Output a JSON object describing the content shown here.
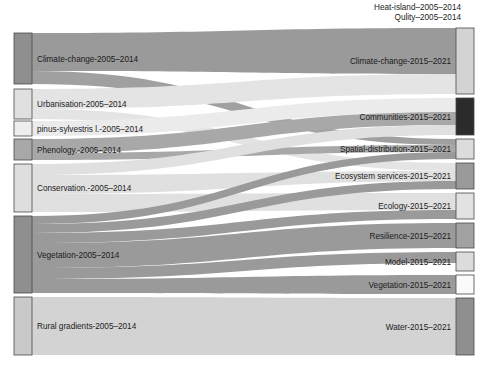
{
  "figure": {
    "type": "sankey",
    "title": "",
    "width": 485,
    "height": 365,
    "background": "#ffffff"
  },
  "floating_labels": [
    {
      "text": "Heat-island–2005–2014",
      "x": 461,
      "y": 10,
      "anchor": "end"
    },
    {
      "text": "Qulity–2005–2014",
      "x": 461,
      "y": 20,
      "anchor": "end"
    }
  ],
  "colors": {
    "node_stroke": "#4a4a4a",
    "dark": "#2b2b2b",
    "mid_dark": "#8f8f8f",
    "mid": "#a8a8a8",
    "light": "#d3d3d3",
    "very_light": "#e8e8e8",
    "near_white": "#f7f7f7",
    "label": "#1b1b1b"
  },
  "chart_data": {
    "type": "sankey",
    "title": "",
    "xlabel": "",
    "ylabel": "",
    "nodes_left": [
      {
        "id": "L0",
        "label": "Climate-change-2005–2014",
        "x": 14,
        "y": 33,
        "w": 18,
        "h": 51,
        "color": "#8f8f8f",
        "value": 51
      },
      {
        "id": "L1",
        "label": "Urbanisation-2005–2014",
        "x": 14,
        "y": 89,
        "w": 18,
        "h": 30,
        "color": "#e0e0e0",
        "value": 30
      },
      {
        "id": "L2",
        "label": "pinus-sylvestris l.-2005–2014",
        "x": 14,
        "y": 121,
        "w": 18,
        "h": 15,
        "color": "#eeeeee",
        "value": 15
      },
      {
        "id": "L3",
        "label": "Phenology.-2005–2014",
        "x": 14,
        "y": 139,
        "w": 18,
        "h": 21,
        "color": "#a8a8a8",
        "value": 21
      },
      {
        "id": "L4",
        "label": "Conservation.-2005–2014",
        "x": 14,
        "y": 164,
        "w": 18,
        "h": 48,
        "color": "#dedede",
        "value": 48
      },
      {
        "id": "L5",
        "label": "Vegetation-2005–2014",
        "x": 14,
        "y": 216,
        "w": 18,
        "h": 77,
        "color": "#8f8f8f",
        "value": 77
      },
      {
        "id": "L6",
        "label": "Rural gradients-2005–2014",
        "x": 14,
        "y": 297,
        "w": 18,
        "h": 58,
        "color": "#c9c9c9",
        "value": 58
      }
    ],
    "nodes_right": [
      {
        "id": "R0",
        "label": "Climate-change-2015–2021",
        "x": 456,
        "y": 28,
        "w": 18,
        "h": 66,
        "color": "#d3d3d3",
        "value": 66
      },
      {
        "id": "R1",
        "label": "Communities-2015–2021",
        "x": 456,
        "y": 98,
        "w": 18,
        "h": 37,
        "color": "#2b2b2b",
        "value": 37
      },
      {
        "id": "R2",
        "label": "Spatial-distribution-2015–2021",
        "x": 456,
        "y": 139,
        "w": 18,
        "h": 20,
        "color": "#dcdcdc",
        "value": 20
      },
      {
        "id": "R3",
        "label": "Ecosystem services-2015–2021",
        "x": 456,
        "y": 163,
        "w": 18,
        "h": 26,
        "color": "#9a9a9a",
        "value": 26
      },
      {
        "id": "R4",
        "label": "Ecology-2015–2021",
        "x": 456,
        "y": 193,
        "w": 18,
        "h": 26,
        "color": "#e2e2e2",
        "value": 26
      },
      {
        "id": "R5",
        "label": "Resilience-2015–2021",
        "x": 456,
        "y": 223,
        "w": 18,
        "h": 25,
        "color": "#a2a2a2",
        "value": 25
      },
      {
        "id": "R6",
        "label": "Model-2015–2021",
        "x": 456,
        "y": 252,
        "w": 18,
        "h": 19,
        "color": "#dcdcdc",
        "value": 19
      },
      {
        "id": "R7",
        "label": "Vegetation-2015–2021",
        "x": 456,
        "y": 275,
        "w": 18,
        "h": 19,
        "color": "#fafafa",
        "value": 19
      },
      {
        "id": "R8",
        "label": "Water-2015–2021",
        "x": 456,
        "y": 298,
        "w": 18,
        "h": 57,
        "color": "#8f8f8f",
        "value": 57
      }
    ],
    "links": [
      {
        "source": "L0",
        "target": "R0",
        "value": 38,
        "color": "#9a9a9a",
        "sy": 33,
        "ty": 28,
        "sh": 38,
        "th": 46
      },
      {
        "source": "L0",
        "target": "R2",
        "value": 13,
        "color": "#a0a0a0",
        "sy": 71,
        "ty": 139,
        "sh": 13,
        "th": 6
      },
      {
        "source": "L1",
        "target": "R0",
        "value": 20,
        "color": "#e4e4e4",
        "sy": 89,
        "ty": 74,
        "sh": 20,
        "th": 20
      },
      {
        "source": "L1",
        "target": "R3",
        "value": 10,
        "color": "#e4e4e4",
        "sy": 109,
        "ty": 163,
        "sh": 10,
        "th": 8
      },
      {
        "source": "L2",
        "target": "R1",
        "value": 15,
        "color": "#ebebeb",
        "sy": 121,
        "ty": 98,
        "sh": 15,
        "th": 14
      },
      {
        "source": "L3",
        "target": "R1",
        "value": 14,
        "color": "#a8a8a8",
        "sy": 139,
        "ty": 112,
        "sh": 14,
        "th": 13
      },
      {
        "source": "L3",
        "target": "R2",
        "value": 7,
        "color": "#a8a8a8",
        "sy": 153,
        "ty": 145,
        "sh": 7,
        "th": 7
      },
      {
        "source": "L4",
        "target": "R1",
        "value": 11,
        "color": "#e0e0e0",
        "sy": 164,
        "ty": 125,
        "sh": 11,
        "th": 10
      },
      {
        "source": "L4",
        "target": "R3",
        "value": 19,
        "color": "#e0e0e0",
        "sy": 175,
        "ty": 171,
        "sh": 19,
        "th": 10
      },
      {
        "source": "L4",
        "target": "R4",
        "value": 18,
        "color": "#e0e0e0",
        "sy": 194,
        "ty": 193,
        "sh": 18,
        "th": 17
      },
      {
        "source": "L5",
        "target": "R2",
        "value": 8,
        "color": "#9a9a9a",
        "sy": 216,
        "ty": 152,
        "sh": 8,
        "th": 7
      },
      {
        "source": "L5",
        "target": "R3",
        "value": 9,
        "color": "#9a9a9a",
        "sy": 224,
        "ty": 181,
        "sh": 9,
        "th": 8
      },
      {
        "source": "L5",
        "target": "R4",
        "value": 10,
        "color": "#9a9a9a",
        "sy": 233,
        "ty": 210,
        "sh": 10,
        "th": 9
      },
      {
        "source": "L5",
        "target": "R5",
        "value": 25,
        "color": "#9a9a9a",
        "sy": 243,
        "ty": 223,
        "sh": 25,
        "th": 25
      },
      {
        "source": "L5",
        "target": "R6",
        "value": 11,
        "color": "#9a9a9a",
        "sy": 268,
        "ty": 252,
        "sh": 11,
        "th": 11
      },
      {
        "source": "L5",
        "target": "R7",
        "value": 14,
        "color": "#9a9a9a",
        "sy": 279,
        "ty": 275,
        "sh": 14,
        "th": 19
      },
      {
        "source": "L6",
        "target": "R8",
        "value": 58,
        "color": "#d3d3d3",
        "sy": 297,
        "ty": 298,
        "sh": 58,
        "th": 57
      }
    ],
    "legend": [],
    "annotations": [
      "Heat-island–2005–2014",
      "Qulity–2005–2014"
    ]
  }
}
